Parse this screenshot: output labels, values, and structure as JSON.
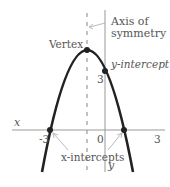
{
  "diagram": {
    "labels": {
      "axis_of_symmetry_line1": "Axis of",
      "axis_of_symmetry_line2": "symmetry",
      "vertex": "Vertex",
      "y_intercept": "y-intercept",
      "x_intercepts": "x-intercepts",
      "x_axis": "x",
      "y_axis": "y"
    },
    "ticks": {
      "x_neg3": "-3",
      "x_zero": "0",
      "x_pos3": "3",
      "y_three": "3"
    },
    "colors": {
      "curve": "#222222",
      "axis": "#999999",
      "text": "#555555",
      "arrow": "#aaaaaa"
    }
  }
}
